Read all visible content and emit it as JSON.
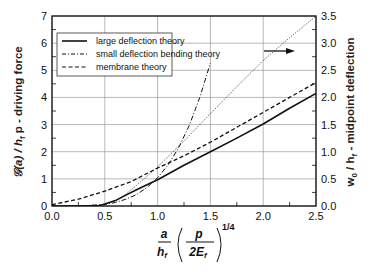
{
  "chart_data": {
    "type": "line",
    "title": "",
    "xlabel": "a/h_f (p/2E_f)^(1/4)",
    "ylabel_left": "G(a) / h_f p - driving force",
    "ylabel_right": "w_0 / h_f - midpoint deflection",
    "xlim": [
      0,
      2.5
    ],
    "ylim_left": [
      0,
      7
    ],
    "ylim_right": [
      0,
      3.5
    ],
    "grid": true,
    "legend_position": "upper left",
    "x_ticks": [
      "0.0",
      "0.5",
      "1.0",
      "1.5",
      "2.0",
      "2.5"
    ],
    "y_ticks_left": [
      "0",
      "1",
      "2",
      "3",
      "4",
      "5",
      "6",
      "7"
    ],
    "y_ticks_right": [
      "0.0",
      "0.5",
      "1.0",
      "1.5",
      "2.0",
      "2.5",
      "3.0",
      "3.5"
    ],
    "series": [
      {
        "name": "large deflection theory",
        "style": "solid",
        "axis": "left",
        "x": [
          0.0,
          0.3,
          0.45,
          0.5,
          0.6,
          0.7,
          0.8,
          0.9,
          1.0,
          1.25,
          1.5,
          1.75,
          2.0,
          2.25,
          2.5
        ],
        "values": [
          0.0,
          0.0,
          0.02,
          0.07,
          0.2,
          0.4,
          0.6,
          0.78,
          0.97,
          1.5,
          2.0,
          2.5,
          3.02,
          3.6,
          4.15
        ]
      },
      {
        "name": "small deflection bending theory",
        "style": "dash-dot",
        "axis": "left",
        "x": [
          0.0,
          0.25,
          0.5,
          0.6,
          0.7,
          0.8,
          0.9,
          1.0,
          1.1,
          1.2,
          1.3,
          1.4,
          1.5
        ],
        "values": [
          0.0,
          0.0,
          0.06,
          0.13,
          0.25,
          0.42,
          0.68,
          1.04,
          1.52,
          2.15,
          2.97,
          4.0,
          5.27
        ]
      },
      {
        "name": "membrane theory",
        "style": "dashed",
        "axis": "left",
        "x": [
          0.0,
          0.25,
          0.5,
          0.75,
          1.0,
          1.25,
          1.5,
          1.75,
          2.0,
          2.25,
          2.5
        ],
        "values": [
          0.05,
          0.25,
          0.55,
          0.9,
          1.4,
          1.85,
          2.35,
          2.9,
          3.45,
          4.0,
          4.55
        ]
      },
      {
        "name": "midpoint deflection",
        "style": "dotted",
        "axis": "right",
        "x": [
          0.0,
          0.4,
          0.5,
          0.6,
          0.7,
          0.8,
          0.9,
          1.0,
          1.25,
          1.5,
          1.75,
          2.0,
          2.25,
          2.5
        ],
        "values": [
          0.0,
          0.0,
          0.03,
          0.1,
          0.22,
          0.38,
          0.55,
          0.72,
          1.2,
          1.7,
          2.2,
          2.68,
          3.1,
          3.5
        ]
      }
    ],
    "annotations": [
      "arrow pointing right (dotted curve refers to right axis)"
    ]
  },
  "labels": {
    "y_left_title": "𝒢(a) / h",
    "y_left_sub": "f",
    "y_left_rest": " p - driving force",
    "y_right_title_a": "w",
    "y_right_sub0": "0",
    "y_right_title_b": " / h",
    "y_right_subf": "f",
    "y_right_title_c": " - midpoint deflection",
    "x_num_a": "a",
    "x_den_h": "h",
    "x_den_f": "f",
    "x_num_p": "p",
    "x_den_2E": "2E",
    "x_den_Ef": "f",
    "x_exp": "1/4"
  },
  "colors": {
    "axis": "#111111",
    "grid": "#9a9a9a",
    "lines": "#111111"
  }
}
